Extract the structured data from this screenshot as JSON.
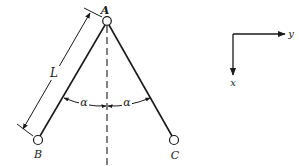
{
  "figure": {
    "type": "pendulum-linkage-diagram",
    "points": {
      "A": {
        "label": "A"
      },
      "B": {
        "label": "B"
      },
      "C": {
        "label": "C"
      }
    },
    "length_label": "L",
    "angle_labels": [
      "α",
      "α"
    ],
    "axes": {
      "horizontal_label": "y",
      "vertical_label": "x"
    },
    "colors": {
      "ink": "#1a1a1a",
      "background": "#ffffff"
    }
  }
}
